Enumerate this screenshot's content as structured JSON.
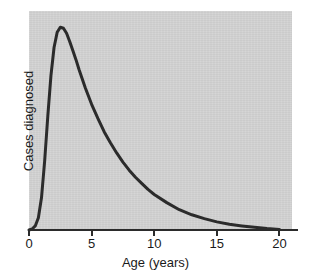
{
  "chart_data": {
    "type": "line",
    "title": "",
    "subtitle": "",
    "xlabel": "Age (years)",
    "ylabel": "Cases diagnosed",
    "xlim": [
      0,
      21
    ],
    "ylim": [
      0,
      1.08
    ],
    "grid": false,
    "legend": null,
    "x_ticks": [
      {
        "value": 0,
        "label": "0"
      },
      {
        "value": 5,
        "label": "5"
      },
      {
        "value": 10,
        "label": "10"
      },
      {
        "value": 15,
        "label": "15"
      },
      {
        "value": 20,
        "label": "20"
      }
    ],
    "y_ticks": [],
    "annotations": [],
    "series": [
      {
        "name": "Cases diagnosed",
        "color": "#2b2b2b",
        "line_width": 3,
        "x": [
          0.0,
          0.25,
          0.5,
          0.75,
          1.0,
          1.25,
          1.5,
          1.75,
          2.0,
          2.25,
          2.5,
          2.75,
          3.0,
          3.25,
          3.5,
          3.75,
          4.0,
          4.5,
          5.0,
          5.5,
          6.0,
          6.5,
          7.0,
          7.5,
          8.0,
          8.5,
          9.0,
          9.5,
          10.0,
          11.0,
          12.0,
          13.0,
          14.0,
          15.0,
          16.0,
          17.0,
          18.0,
          19.0,
          20.0
        ],
        "y": [
          0.0,
          0.005,
          0.02,
          0.06,
          0.16,
          0.34,
          0.56,
          0.76,
          0.9,
          0.975,
          1.0,
          0.995,
          0.97,
          0.93,
          0.885,
          0.84,
          0.79,
          0.7,
          0.62,
          0.55,
          0.485,
          0.43,
          0.38,
          0.335,
          0.295,
          0.26,
          0.23,
          0.2,
          0.175,
          0.135,
          0.1,
          0.075,
          0.056,
          0.04,
          0.028,
          0.02,
          0.013,
          0.007,
          0.003
        ]
      }
    ]
  },
  "figure": {
    "panel_color": "#d2d2d2",
    "background_color": "#ffffff",
    "axis_color": "#2b2b2b"
  }
}
